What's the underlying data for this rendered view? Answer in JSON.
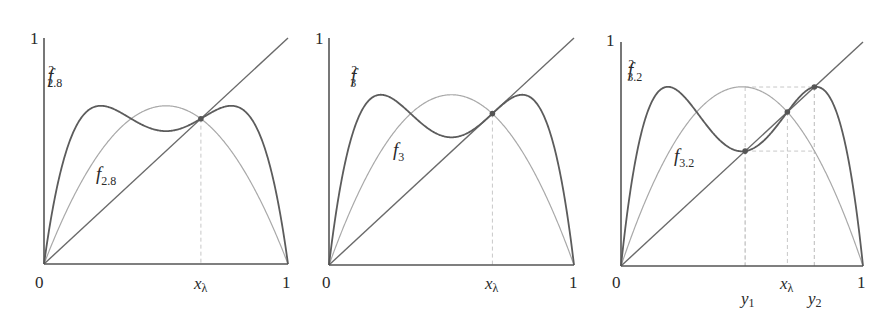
{
  "chart_data": [
    {
      "type": "line",
      "title": "",
      "r": 2.8,
      "xlim": [
        0,
        1
      ],
      "ylim": [
        0,
        1
      ],
      "axis_ticks": {
        "x": [
          "0",
          "1"
        ],
        "y": [
          "1"
        ]
      },
      "series": [
        {
          "name": "y = x",
          "formula": "x"
        },
        {
          "name": "f_{2.8}",
          "formula": "2.8 x (1 - x)",
          "peak": 0.7
        },
        {
          "name": "f^2_{2.8}",
          "formula": "f_{2.8}(f_{2.8}(x))"
        }
      ],
      "annotations": [
        {
          "label": "x_λ",
          "x": 0.643,
          "y": 0.643,
          "marker": "dot",
          "dashed_to_axis": true
        }
      ],
      "grid": false
    },
    {
      "type": "line",
      "title": "",
      "r": 3.0,
      "xlim": [
        0,
        1
      ],
      "ylim": [
        0,
        1
      ],
      "axis_ticks": {
        "x": [
          "0",
          "1"
        ],
        "y": [
          "1"
        ]
      },
      "series": [
        {
          "name": "y = x",
          "formula": "x"
        },
        {
          "name": "f_3",
          "formula": "3 x (1 - x)",
          "peak": 0.75
        },
        {
          "name": "f^2_3",
          "formula": "f_3(f_3(x))"
        }
      ],
      "annotations": [
        {
          "label": "x_λ",
          "x": 0.667,
          "y": 0.667,
          "marker": "dot",
          "dashed_to_axis": true
        }
      ],
      "grid": false
    },
    {
      "type": "line",
      "title": "",
      "r": 3.2,
      "xlim": [
        0,
        1
      ],
      "ylim": [
        0,
        1
      ],
      "axis_ticks": {
        "x": [
          "0",
          "1"
        ],
        "y": [
          "1"
        ]
      },
      "series": [
        {
          "name": "y = x",
          "formula": "x"
        },
        {
          "name": "f_{3.2}",
          "formula": "3.2 x (1 - x)",
          "peak": 0.8
        },
        {
          "name": "f^2_{3.2}",
          "formula": "f_{3.2}(f_{3.2}(x))"
        }
      ],
      "annotations": [
        {
          "label": "y_1",
          "x": 0.513,
          "y": 0.513,
          "marker": "dot",
          "dashed_to_axis": true
        },
        {
          "label": "x_λ",
          "x": 0.6875,
          "y": 0.6875,
          "marker": "dot",
          "dashed_to_axis": true
        },
        {
          "label": "y_2",
          "x": 0.799,
          "y": 0.799,
          "marker": "dot",
          "dashed_to_axis": true
        }
      ],
      "grid": false
    }
  ],
  "panels": [
    {
      "origin_label": "0",
      "x_end_label": "1",
      "y_end_label": "1",
      "f_label": "f",
      "f_sub": "2.8",
      "f2_label": "f",
      "f2_sup": "2",
      "f2_sub": "2.8",
      "xl_label": "x",
      "xl_sub": "λ"
    },
    {
      "origin_label": "0",
      "x_end_label": "1",
      "y_end_label": "1",
      "f_label": "f",
      "f_sub": "3",
      "f2_label": "f",
      "f2_sup": "2",
      "f2_sub": "3",
      "xl_label": "x",
      "xl_sub": "λ"
    },
    {
      "origin_label": "0",
      "x_end_label": "1",
      "y_end_label": "1",
      "f_label": "f",
      "f_sub": "3.2",
      "f2_label": "f",
      "f2_sup": "2",
      "f2_sub": "3.2",
      "xl_label": "x",
      "xl_sub": "λ",
      "y1_label": "y",
      "y1_sub": "1",
      "y2_label": "y",
      "y2_sub": "2"
    }
  ]
}
